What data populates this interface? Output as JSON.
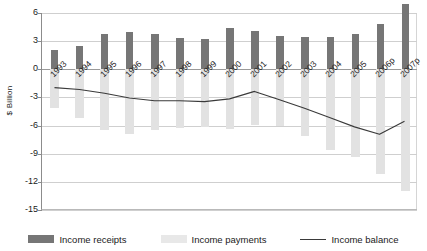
{
  "chart_data": {
    "type": "bar",
    "title": "",
    "xlabel": "",
    "ylabel": "$ Billion",
    "ylim": [
      -15,
      6
    ],
    "yticks": [
      6,
      3,
      0,
      -3,
      -6,
      -9,
      -12,
      -15
    ],
    "ytick_labels": [
      "6",
      "3",
      "0",
      "-3",
      "-6",
      "-9",
      "-12",
      "-15"
    ],
    "grid": true,
    "legend_position": "bottom",
    "categories": [
      "1993",
      "1994",
      "1995",
      "1996",
      "1997",
      "1998",
      "1999",
      "2000",
      "2001",
      "2002",
      "2003",
      "2004",
      "2005",
      "2006p",
      "2007p"
    ],
    "series": [
      {
        "name": "Income receipts",
        "type": "bar",
        "color": "#767676",
        "values": [
          2.1,
          2.5,
          3.8,
          4.0,
          3.8,
          3.3,
          3.2,
          4.4,
          4.1,
          3.6,
          3.4,
          3.4,
          3.8,
          4.8,
          7.0
        ]
      },
      {
        "name": "Income payments",
        "type": "bar",
        "color": "#e2e2e2",
        "values": [
          -4.1,
          -5.2,
          -6.5,
          -6.9,
          -6.5,
          -6.3,
          -6.1,
          -6.4,
          -5.9,
          -6.0,
          -7.1,
          -8.6,
          -9.4,
          -11.2,
          -13.0
        ]
      },
      {
        "name": "Income balance",
        "type": "line",
        "color": "#3a3a3a",
        "values": [
          -2.0,
          -2.2,
          -2.6,
          -3.1,
          -3.4,
          -3.4,
          -3.5,
          -3.2,
          -2.4,
          -3.3,
          -4.2,
          -5.2,
          -6.2,
          -7.0,
          -5.6
        ]
      }
    ]
  },
  "legend": {
    "items": [
      {
        "label": "Income receipts",
        "swatch": "receipts-swatch"
      },
      {
        "label": "Income payments",
        "swatch": "payments-swatch"
      },
      {
        "label": "Income balance",
        "swatch": "line-swatch"
      }
    ]
  }
}
